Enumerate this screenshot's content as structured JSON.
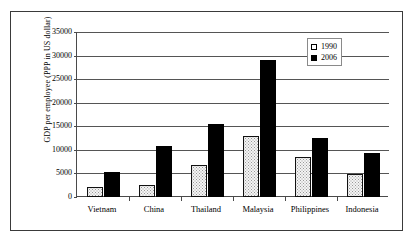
{
  "chart_data": {
    "type": "bar",
    "title": "",
    "xlabel": "",
    "ylabel": "GDP per employee (PPP in US dollar)",
    "ylim": [
      0,
      35000
    ],
    "ytick_step": 5000,
    "yticks": [
      "35000",
      "30000",
      "25000",
      "20000",
      "15000",
      "10000",
      "5000",
      "0"
    ],
    "ytick_values": [
      35000,
      30000,
      25000,
      20000,
      15000,
      10000,
      5000,
      0
    ],
    "grid": true,
    "legend_position": "top-right",
    "categories": [
      "Vietnam",
      "China",
      "Thailand",
      "Malaysia",
      "Philippines",
      "Indonesia"
    ],
    "series": [
      {
        "name": "1990",
        "marker": "hollow-square",
        "color": "#f4f4f4",
        "values": [
          2200,
          2500,
          6800,
          12900,
          8400,
          4900
        ]
      },
      {
        "name": "2006",
        "marker": "filled-square",
        "color": "#000000",
        "values": [
          5400,
          10800,
          15500,
          29000,
          12500,
          9300
        ]
      }
    ]
  }
}
